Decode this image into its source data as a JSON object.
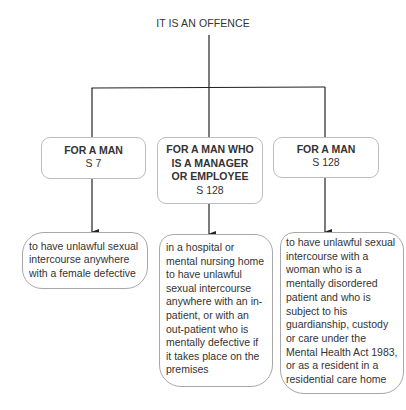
{
  "diagram": {
    "root": {
      "label": "IT IS AN OFFENCE"
    },
    "branches": [
      {
        "who": "FOR A MAN",
        "section": "S 7",
        "description": "to have unlawful sexual\nintercourse anywhere\nwith a female defective"
      },
      {
        "who": "FOR A MAN WHO\nIS A MANAGER\nOR EMPLOYEE",
        "section": "S 128",
        "description": "in a hospital or\nmental nursing home\nto have unlawful\nsexual intercourse\nanywhere with an in-\npatient, or with an\nout-patient who is\nmentally defective if\nit takes place on the\npremises"
      },
      {
        "who": "FOR A MAN",
        "section": "S 128",
        "description": "to have unlawful sexual\nintercourse with a\nwoman who is a\nmentally disordered\npatient and who is\nsubject to his\nguardianship, custody\nor care under the\nMental Health Act 1983,\nor as a resident in a\nresidential care home"
      }
    ],
    "colors": {
      "line": "#222222",
      "box_border": "#bdbdbd",
      "text": "#333333"
    }
  }
}
